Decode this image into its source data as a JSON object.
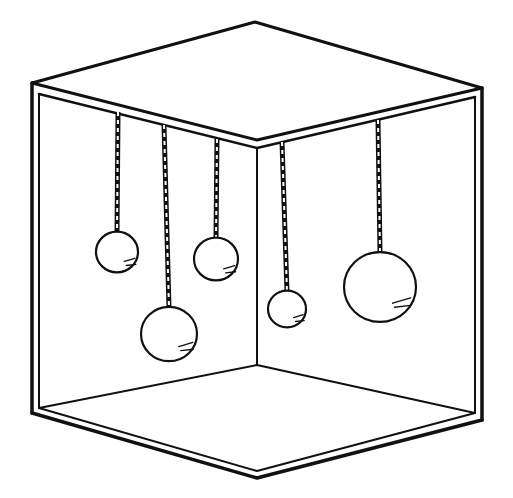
{
  "figure": {
    "colors": {
      "line": "#111111",
      "background": "#ffffff"
    },
    "box": {
      "top_apex": [
        255,
        22
      ],
      "top_left": [
        32,
        83
      ],
      "top_right": [
        482,
        88
      ],
      "inner_ceiling_corner": [
        257,
        145
      ],
      "inner_floor_corner": [
        257,
        365
      ],
      "bottom_left": [
        32,
        413
      ],
      "bottom_apex": [
        257,
        478
      ],
      "bottom_right": [
        482,
        420
      ]
    },
    "balls": [
      {
        "id": "ball-1",
        "rope_top": [
          118,
          112
        ],
        "cx": 117,
        "cy": 252,
        "r": 21
      },
      {
        "id": "ball-2",
        "rope_top": [
          164,
          125
        ],
        "cx": 169,
        "cy": 334,
        "r": 28
      },
      {
        "id": "ball-3",
        "rope_top": [
          217,
          139
        ],
        "cx": 216,
        "cy": 259,
        "r": 22
      },
      {
        "id": "ball-4",
        "rope_top": [
          282,
          142
        ],
        "cx": 287,
        "cy": 309,
        "r": 19
      },
      {
        "id": "ball-5",
        "rope_top": [
          378,
          120
        ],
        "cx": 380,
        "cy": 287,
        "r": 36
      }
    ]
  }
}
